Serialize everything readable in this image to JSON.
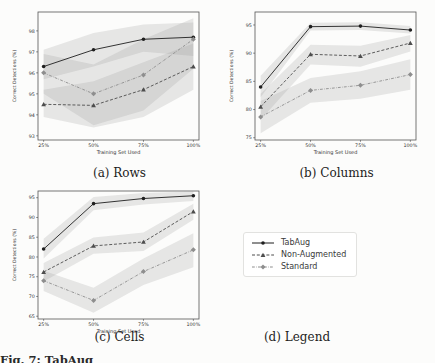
{
  "figure": {
    "caption_fragment": "Fig. 7: TabAug",
    "background": "#fcfcfb"
  },
  "legend": {
    "caption": "(d) Legend",
    "band_color": "#909090",
    "entries": [
      {
        "label": "TabAug",
        "color": "#1f1f1f",
        "line": "solid",
        "marker": "circle"
      },
      {
        "label": "Non-Augmented",
        "color": "#4d4d4d",
        "line": "dashed",
        "marker": "triangle"
      },
      {
        "label": "Standard",
        "color": "#8e8e8e",
        "line": "dashdot",
        "marker": "diamond"
      }
    ]
  },
  "chart_data": [
    {
      "type": "line",
      "caption": "(a) Rows",
      "xlabel": "Training Set Used",
      "ylabel": "Correct Detections (%)",
      "categories": [
        "25%",
        "50%",
        "75%",
        "100%"
      ],
      "yticks": [
        93,
        94,
        95,
        96,
        97,
        98
      ],
      "ylim": [
        92.8,
        98.9
      ],
      "legend_position": "none",
      "grid": false,
      "series": [
        {
          "name": "TabAug",
          "values": [
            96.3,
            97.1,
            97.6,
            97.7
          ],
          "band_lo": [
            95.7,
            96.3,
            97.0,
            96.8
          ],
          "band_hi": [
            97.1,
            97.9,
            98.3,
            98.4
          ]
        },
        {
          "name": "Non-Augmented",
          "values": [
            94.5,
            94.45,
            95.2,
            96.3
          ],
          "band_lo": [
            93.9,
            93.4,
            93.9,
            95.2
          ],
          "band_hi": [
            95.2,
            95.6,
            96.5,
            97.4
          ]
        },
        {
          "name": "Standard",
          "values": [
            96.0,
            95.0,
            95.9,
            97.6
          ],
          "band_lo": [
            95.0,
            93.5,
            94.2,
            96.2
          ],
          "band_hi": [
            96.9,
            96.4,
            97.6,
            98.6
          ]
        }
      ]
    },
    {
      "type": "line",
      "caption": "(b) Columns",
      "xlabel": "Training Set Used",
      "ylabel": "Correct Detections (%)",
      "categories": [
        "25%",
        "50%",
        "75%",
        "100%"
      ],
      "yticks": [
        75,
        80,
        85,
        90,
        95
      ],
      "ylim": [
        74.6,
        97.3
      ],
      "legend_position": "none",
      "grid": false,
      "series": [
        {
          "name": "TabAug",
          "values": [
            84.0,
            94.7,
            94.8,
            94.1
          ],
          "band_lo": [
            82.2,
            94.0,
            94.1,
            93.5
          ],
          "band_hi": [
            86.0,
            95.4,
            95.5,
            94.8
          ]
        },
        {
          "name": "Non-Augmented",
          "values": [
            80.5,
            89.8,
            89.5,
            91.8
          ],
          "band_lo": [
            78.2,
            88.0,
            87.6,
            90.3
          ],
          "band_hi": [
            82.8,
            91.5,
            91.3,
            93.2
          ]
        },
        {
          "name": "Standard",
          "values": [
            78.7,
            83.4,
            84.3,
            86.2
          ],
          "band_lo": [
            75.8,
            81.2,
            81.9,
            83.5
          ],
          "band_hi": [
            81.5,
            85.6,
            86.8,
            88.9
          ]
        }
      ]
    },
    {
      "type": "line",
      "caption": "(c) Cells",
      "xlabel": "Training Set Used",
      "ylabel": "Correct Detections (%)",
      "categories": [
        "25%",
        "50%",
        "75%",
        "100%"
      ],
      "yticks": [
        65,
        70,
        75,
        80,
        85,
        90,
        95
      ],
      "ylim": [
        64.3,
        96.7
      ],
      "legend_position": "none",
      "grid": false,
      "series": [
        {
          "name": "TabAug",
          "values": [
            82.0,
            93.5,
            94.8,
            95.5
          ],
          "band_lo": [
            79.6,
            91.8,
            93.3,
            94.2
          ],
          "band_hi": [
            84.6,
            95.2,
            96.2,
            96.6
          ]
        },
        {
          "name": "Non-Augmented",
          "values": [
            76.2,
            82.8,
            83.8,
            91.5
          ],
          "band_lo": [
            73.8,
            80.8,
            81.5,
            89.4
          ],
          "band_hi": [
            78.5,
            84.9,
            86.2,
            93.5
          ]
        },
        {
          "name": "Standard",
          "values": [
            74.0,
            69.0,
            76.3,
            81.8
          ],
          "band_lo": [
            71.4,
            65.9,
            72.9,
            77.4
          ],
          "band_hi": [
            76.5,
            72.2,
            79.6,
            86.0
          ]
        }
      ]
    }
  ]
}
